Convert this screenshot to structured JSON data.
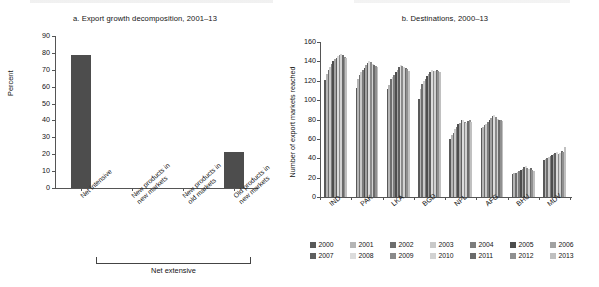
{
  "figure": {
    "background": "#ffffff",
    "dark_gray": "#4d4d4d"
  },
  "panel_a": {
    "title": "a. Export growth decomposition, 2001–13",
    "ylabel": "Percent",
    "bracket_label": "Net extensive"
  },
  "panel_b": {
    "title": "b. Destinations, 2000–13",
    "ylabel": "Number of export markets\nreached"
  },
  "chart_data": [
    {
      "type": "bar",
      "id": "panel-a",
      "title": "a. Export growth decomposition, 2001–13",
      "xlabel": "",
      "ylabel": "Percent",
      "ylim": [
        0,
        90
      ],
      "yticks": [
        0,
        10,
        20,
        30,
        40,
        50,
        60,
        70,
        80,
        90
      ],
      "grid": false,
      "legend": "none",
      "categories": [
        "Net intensive",
        "New products in new markets",
        "New products in old markets",
        "Old products in new markets"
      ],
      "category_lines": [
        [
          "Net intensive"
        ],
        [
          "New products in",
          "new markets"
        ],
        [
          "New products in",
          "old markets"
        ],
        [
          "Old products in",
          "new markets"
        ]
      ],
      "values": [
        78.5,
        0,
        0,
        21.5
      ],
      "bar_color": "#4d4d4d",
      "annotations": [
        {
          "text": "Net extensive",
          "covers": [
            "New products in new markets",
            "New products in old markets",
            "Old products in new markets"
          ]
        }
      ]
    },
    {
      "type": "bar",
      "id": "panel-b",
      "title": "b. Destinations, 2000–13",
      "xlabel": "",
      "ylabel": "Number of export markets reached",
      "ylim": [
        0,
        160
      ],
      "yticks": [
        0,
        20,
        40,
        60,
        80,
        100,
        120,
        140,
        160
      ],
      "grid": false,
      "legend_position": "bottom",
      "categories": [
        "IND",
        "PAK",
        "LKA",
        "BGD",
        "NPL",
        "AFG",
        "BHU",
        "MDV"
      ],
      "series": [
        {
          "name": "2000",
          "color": "#595959",
          "values": [
            121,
            113,
            111,
            101,
            60,
            71,
            24,
            38
          ]
        },
        {
          "name": "2001",
          "color": "#b5b5b5",
          "values": [
            127,
            122,
            116,
            111,
            64,
            72,
            25,
            39
          ]
        },
        {
          "name": "2002",
          "color": "#6e6e6e",
          "values": [
            131,
            126,
            122,
            117,
            66,
            74,
            25,
            40
          ]
        },
        {
          "name": "2003",
          "color": "#c9c9c9",
          "values": [
            134,
            129,
            124,
            120,
            70,
            75,
            26,
            41
          ]
        },
        {
          "name": "2004",
          "color": "#7d7d7d",
          "values": [
            137,
            131,
            126,
            122,
            72,
            77,
            27,
            42
          ]
        },
        {
          "name": "2005",
          "color": "#4d4d4d",
          "values": [
            140,
            133,
            129,
            125,
            75,
            80,
            28,
            43
          ]
        },
        {
          "name": "2006",
          "color": "#a2a2a2",
          "values": [
            142,
            136,
            131,
            127,
            76,
            82,
            29,
            44
          ]
        },
        {
          "name": "2007",
          "color": "#5f5f5f",
          "values": [
            144,
            138,
            134,
            129,
            79,
            84,
            31,
            45
          ]
        },
        {
          "name": "2008",
          "color": "#dcdcdc",
          "values": [
            146,
            140,
            136,
            131,
            80,
            85,
            32,
            46
          ]
        },
        {
          "name": "2009",
          "color": "#8a8a8a",
          "values": [
            147,
            139,
            135,
            130,
            77,
            83,
            30,
            44
          ]
        },
        {
          "name": "2010",
          "color": "#d2d2d2",
          "values": [
            148,
            137,
            134,
            130,
            76,
            81,
            29,
            45
          ]
        },
        {
          "name": "2011",
          "color": "#6b6b6b",
          "values": [
            147,
            136,
            133,
            131,
            78,
            80,
            30,
            47
          ]
        },
        {
          "name": "2012",
          "color": "#909090",
          "values": [
            145,
            135,
            132,
            130,
            79,
            79,
            28,
            46
          ]
        },
        {
          "name": "2013",
          "color": "#c0c0c0",
          "values": [
            143,
            134,
            130,
            129,
            77,
            78,
            27,
            52
          ]
        }
      ]
    }
  ],
  "legend": {
    "rows": [
      [
        "2000",
        "2001",
        "2002",
        "2003",
        "2004",
        "2005",
        "2006"
      ],
      [
        "2007",
        "2008",
        "2009",
        "2010",
        "2011",
        "2012",
        "2013"
      ]
    ]
  }
}
